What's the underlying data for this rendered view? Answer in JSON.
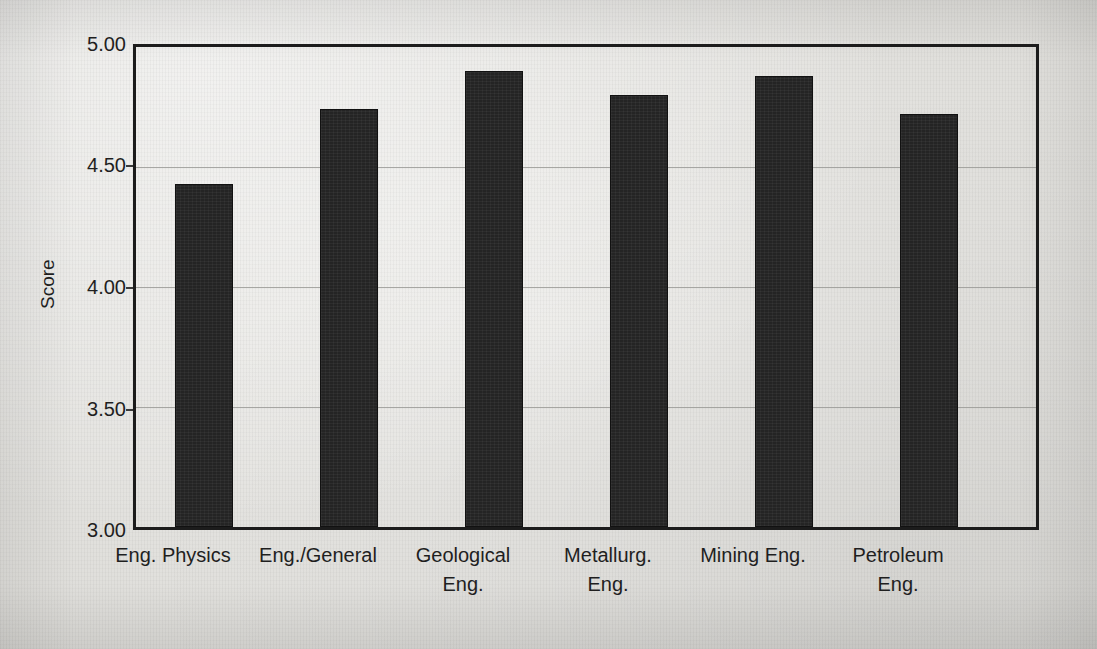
{
  "chart_data": {
    "type": "bar",
    "title": "",
    "subtitle": "",
    "xlabel": "",
    "ylabel": "Score",
    "ylim": [
      3.0,
      5.0
    ],
    "yticks": [
      "3.00",
      "3.50",
      "4.00",
      "4.50",
      "5.00"
    ],
    "ytick_values": [
      3.0,
      3.5,
      4.0,
      4.5,
      5.0
    ],
    "grid": true,
    "legend": null,
    "legend_position": "none",
    "bar_color": "#242424",
    "frame_color": "#1c1c1c",
    "gridline_color": "#9a9a96",
    "background_color": "#e8e7e3",
    "categories": [
      "Eng. Physics",
      "Eng./General",
      "Geological Eng.",
      "Metallurg. Eng.",
      "Mining Eng.",
      "Petroleum Eng."
    ],
    "category_lines": [
      [
        "Eng. Physics",
        ""
      ],
      [
        "Eng./General",
        ""
      ],
      [
        "Geological",
        "Eng."
      ],
      [
        "Metallurg.",
        "Eng."
      ],
      [
        "Mining Eng.",
        ""
      ],
      [
        "Petroleum",
        "Eng."
      ]
    ],
    "values": [
      4.43,
      4.74,
      4.9,
      4.8,
      4.88,
      4.72
    ]
  }
}
